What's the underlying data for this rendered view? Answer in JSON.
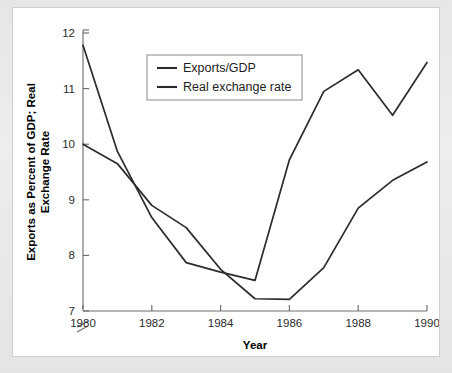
{
  "figure": {
    "background_color": "#e9e9e9",
    "panel_color": "#ffffff",
    "line_color": "#2b2b2b",
    "axis_color": "#6e6e6e",
    "top_sliver_text": ""
  },
  "chart_data": {
    "type": "line",
    "title": "",
    "xlabel": "Year",
    "ylabel": "Exports as Percent of GDP; Real Exchange Rate",
    "x": [
      1980,
      1981,
      1982,
      1983,
      1984,
      1985,
      1986,
      1987,
      1988,
      1989,
      1990
    ],
    "xlim": [
      1980,
      1990
    ],
    "ylim": [
      7,
      12
    ],
    "xticks": [
      1980,
      1982,
      1984,
      1986,
      1988,
      1990
    ],
    "xtick_labels": [
      "1980",
      "1982",
      "1984",
      "1986",
      "1988",
      "1990"
    ],
    "yticks": [
      7,
      8,
      9,
      10,
      11,
      12
    ],
    "ytick_labels": [
      "7",
      "8",
      "9",
      "10",
      "11",
      "12"
    ],
    "y_axis_break": true,
    "grid": false,
    "legend_position": "upper-center-left",
    "series": [
      {
        "name": "Exports/GDP",
        "values": [
          10.0,
          9.65,
          8.9,
          8.5,
          7.75,
          7.22,
          7.21,
          7.78,
          8.85,
          9.35,
          9.68
        ]
      },
      {
        "name": "Real exchange rate",
        "values": [
          11.78,
          9.87,
          8.68,
          7.87,
          7.7,
          7.55,
          9.72,
          10.95,
          11.34,
          10.52,
          11.47
        ]
      }
    ]
  },
  "legend": {
    "entries": [
      {
        "label": "Exports/GDP"
      },
      {
        "label": "Real exchange rate"
      }
    ]
  }
}
